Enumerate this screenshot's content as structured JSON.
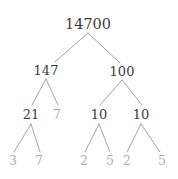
{
  "figure": {
    "kind": "factor-tree",
    "background_color": "#ffffff",
    "composite_color": "#3c3c3c",
    "prime_color": "#b0b0b0",
    "edge_color": "#8c8c8c"
  },
  "tree": {
    "root_value": "14700",
    "nodes": [
      {
        "id": "n0",
        "label": "14700",
        "kind": "composite",
        "level": 0,
        "x": 88,
        "y": 24
      },
      {
        "id": "n1",
        "label": "147",
        "kind": "composite",
        "level": 1,
        "x": 46,
        "y": 70
      },
      {
        "id": "n2",
        "label": "100",
        "kind": "composite",
        "level": 1,
        "x": 122,
        "y": 71
      },
      {
        "id": "n3",
        "label": "21",
        "kind": "composite",
        "level": 2,
        "x": 31,
        "y": 114
      },
      {
        "id": "n4",
        "label": "7",
        "kind": "prime",
        "level": 2,
        "x": 57,
        "y": 114
      },
      {
        "id": "n5",
        "label": "10",
        "kind": "composite",
        "level": 2,
        "x": 99,
        "y": 114
      },
      {
        "id": "n6",
        "label": "10",
        "kind": "composite",
        "level": 2,
        "x": 141,
        "y": 114
      },
      {
        "id": "n7",
        "label": "3",
        "kind": "prime",
        "level": 3,
        "x": 13,
        "y": 161
      },
      {
        "id": "n8",
        "label": "7",
        "kind": "prime",
        "level": 3,
        "x": 39,
        "y": 161
      },
      {
        "id": "n9",
        "label": "2",
        "kind": "prime",
        "level": 3,
        "x": 84,
        "y": 161
      },
      {
        "id": "n10",
        "label": "5",
        "kind": "prime",
        "level": 3,
        "x": 110,
        "y": 161
      },
      {
        "id": "n11",
        "label": "2",
        "kind": "prime",
        "level": 3,
        "x": 127,
        "y": 161
      },
      {
        "id": "n12",
        "label": "5",
        "kind": "prime",
        "level": 3,
        "x": 162,
        "y": 161
      }
    ],
    "edges": [
      {
        "from": "n0",
        "to": "n1",
        "x1": 88,
        "y1": 33,
        "x2": 55,
        "y2": 62
      },
      {
        "from": "n0",
        "to": "n2",
        "x1": 88,
        "y1": 33,
        "x2": 120,
        "y2": 63
      },
      {
        "from": "n1",
        "to": "n3",
        "x1": 46,
        "y1": 79,
        "x2": 32,
        "y2": 105
      },
      {
        "from": "n1",
        "to": "n4",
        "x1": 46,
        "y1": 79,
        "x2": 58,
        "y2": 105
      },
      {
        "from": "n2",
        "to": "n5",
        "x1": 122,
        "y1": 80,
        "x2": 100,
        "y2": 105
      },
      {
        "from": "n2",
        "to": "n6",
        "x1": 122,
        "y1": 80,
        "x2": 142,
        "y2": 105
      },
      {
        "from": "n3",
        "to": "n7",
        "x1": 31,
        "y1": 124,
        "x2": 14,
        "y2": 152
      },
      {
        "from": "n3",
        "to": "n8",
        "x1": 31,
        "y1": 124,
        "x2": 40,
        "y2": 152
      },
      {
        "from": "n5",
        "to": "n9",
        "x1": 99,
        "y1": 124,
        "x2": 85,
        "y2": 152
      },
      {
        "from": "n5",
        "to": "n10",
        "x1": 99,
        "y1": 124,
        "x2": 110,
        "y2": 152
      },
      {
        "from": "n6",
        "to": "n11",
        "x1": 141,
        "y1": 124,
        "x2": 127,
        "y2": 152
      },
      {
        "from": "n6",
        "to": "n12",
        "x1": 141,
        "y1": 124,
        "x2": 160,
        "y2": 152
      }
    ]
  }
}
